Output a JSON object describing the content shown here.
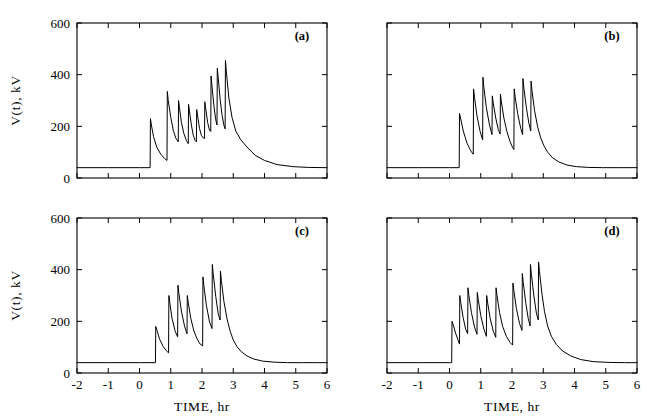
{
  "figure": {
    "axis_titles": {
      "x": "TIME, hr",
      "y": "V(t), kV"
    },
    "panel_tags": [
      "(a)",
      "(b)",
      "(c)",
      "(d)"
    ],
    "x_tick_labels": [
      "-2",
      "-1",
      "0",
      "1",
      "2",
      "3",
      "4",
      "5",
      "6"
    ],
    "y_tick_labels": [
      "0",
      "200",
      "400",
      "600"
    ],
    "line_color": "#000000",
    "background_color": "#ffffff"
  },
  "chart_data": [
    {
      "type": "line",
      "title": "(a)",
      "xlabel": "TIME, hr",
      "ylabel": "V(t), kV",
      "xlim": [
        -2,
        6
      ],
      "ylim": [
        0,
        600
      ],
      "xticks": [
        -2,
        -1,
        0,
        1,
        2,
        3,
        4,
        5,
        6
      ],
      "yticks": [
        0,
        200,
        400,
        600
      ],
      "grid": false,
      "legend": "none",
      "baseline_kv": 40,
      "onset_hr": 0.35,
      "series": [
        {
          "name": "V(t) panel a",
          "x": [
            -2.0,
            -1.0,
            0.0,
            0.34,
            0.35,
            0.38,
            0.45,
            0.55,
            0.68,
            0.8,
            0.88,
            0.89,
            0.92,
            1.0,
            1.08,
            1.16,
            1.24,
            1.25,
            1.28,
            1.34,
            1.42,
            1.5,
            1.56,
            1.57,
            1.6,
            1.66,
            1.72,
            1.78,
            1.82,
            1.83,
            1.86,
            1.92,
            1.98,
            2.04,
            2.08,
            2.09,
            2.12,
            2.18,
            2.24,
            2.28,
            2.29,
            2.32,
            2.38,
            2.44,
            2.48,
            2.49,
            2.52,
            2.58,
            2.64,
            2.7,
            2.74,
            2.75,
            2.78,
            2.86,
            2.96,
            3.08,
            3.24,
            3.44,
            3.7,
            4.0,
            4.4,
            4.9,
            5.4,
            6.0
          ],
          "y": [
            40,
            40,
            40,
            40,
            230,
            205,
            160,
            120,
            92,
            76,
            68,
            335,
            300,
            235,
            185,
            155,
            140,
            300,
            272,
            216,
            172,
            145,
            133,
            285,
            258,
            205,
            166,
            145,
            140,
            265,
            240,
            192,
            165,
            155,
            153,
            295,
            268,
            215,
            185,
            180,
            395,
            355,
            280,
            225,
            205,
            425,
            385,
            305,
            245,
            205,
            190,
            455,
            410,
            310,
            235,
            182,
            148,
            120,
            88,
            68,
            52,
            44,
            41,
            40
          ]
        }
      ]
    },
    {
      "type": "line",
      "title": "(b)",
      "xlabel": "TIME, hr",
      "ylabel": "V(t), kV",
      "xlim": [
        -2,
        6
      ],
      "ylim": [
        0,
        600
      ],
      "xticks": [
        -2,
        -1,
        0,
        1,
        2,
        3,
        4,
        5,
        6
      ],
      "yticks": [
        0,
        200,
        400,
        600
      ],
      "grid": false,
      "legend": "none",
      "baseline_kv": 40,
      "onset_hr": 0.32,
      "series": [
        {
          "name": "V(t) panel b",
          "x": [
            -2.0,
            -1.0,
            0.0,
            0.31,
            0.32,
            0.36,
            0.44,
            0.56,
            0.68,
            0.76,
            0.77,
            0.8,
            0.88,
            0.98,
            1.06,
            1.07,
            1.1,
            1.18,
            1.28,
            1.36,
            1.37,
            1.4,
            1.48,
            1.56,
            1.62,
            1.63,
            1.66,
            1.74,
            1.84,
            1.94,
            2.02,
            2.06,
            2.07,
            2.1,
            2.18,
            2.28,
            2.34,
            2.35,
            2.38,
            2.46,
            2.54,
            2.6,
            2.61,
            2.64,
            2.72,
            2.82,
            2.92,
            3.02,
            3.14,
            3.3,
            3.5,
            3.76,
            4.06,
            4.44,
            4.9,
            5.4,
            6.0
          ],
          "y": [
            40,
            40,
            40,
            40,
            250,
            228,
            182,
            135,
            105,
            92,
            345,
            312,
            240,
            180,
            148,
            390,
            350,
            272,
            205,
            168,
            318,
            290,
            232,
            188,
            170,
            325,
            295,
            232,
            178,
            140,
            118,
            110,
            345,
            315,
            250,
            192,
            168,
            385,
            348,
            272,
            212,
            182,
            375,
            338,
            262,
            198,
            155,
            125,
            100,
            78,
            62,
            50,
            44,
            41,
            40,
            40,
            40
          ]
        }
      ]
    },
    {
      "type": "line",
      "title": "(c)",
      "xlabel": "TIME, hr",
      "ylabel": "V(t), kV",
      "xlim": [
        -2,
        6
      ],
      "ylim": [
        0,
        600
      ],
      "xticks": [
        -2,
        -1,
        0,
        1,
        2,
        3,
        4,
        5,
        6
      ],
      "yticks": [
        0,
        200,
        400,
        600
      ],
      "grid": false,
      "legend": "none",
      "baseline_kv": 40,
      "onset_hr": 0.52,
      "series": [
        {
          "name": "V(t) panel c",
          "x": [
            -2.0,
            -1.0,
            0.0,
            0.51,
            0.52,
            0.56,
            0.64,
            0.76,
            0.86,
            0.93,
            0.94,
            0.97,
            1.04,
            1.14,
            1.22,
            1.23,
            1.26,
            1.34,
            1.44,
            1.52,
            1.53,
            1.56,
            1.64,
            1.74,
            1.84,
            1.94,
            2.02,
            2.03,
            2.06,
            2.14,
            2.24,
            2.32,
            2.33,
            2.36,
            2.44,
            2.52,
            2.58,
            2.59,
            2.62,
            2.7,
            2.8,
            2.9,
            3.0,
            3.12,
            3.26,
            3.44,
            3.66,
            3.94,
            4.3,
            4.74,
            5.24,
            5.7,
            6.0
          ],
          "y": [
            40,
            40,
            40,
            40,
            180,
            165,
            132,
            102,
            86,
            78,
            300,
            272,
            212,
            162,
            140,
            340,
            308,
            240,
            182,
            152,
            300,
            272,
            212,
            163,
            132,
            112,
            105,
            372,
            338,
            262,
            198,
            172,
            420,
            382,
            296,
            228,
            205,
            395,
            358,
            278,
            210,
            162,
            128,
            102,
            82,
            66,
            54,
            46,
            42,
            40,
            40,
            40,
            40
          ]
        }
      ]
    },
    {
      "type": "line",
      "title": "(d)",
      "xlabel": "TIME, hr",
      "ylabel": "V(t), kV",
      "xlim": [
        -2,
        6
      ],
      "ylim": [
        0,
        600
      ],
      "xticks": [
        -2,
        -1,
        0,
        1,
        2,
        3,
        4,
        5,
        6
      ],
      "yticks": [
        0,
        200,
        400,
        600
      ],
      "grid": false,
      "legend": "none",
      "baseline_kv": 40,
      "onset_hr": 0.08,
      "series": [
        {
          "name": "V(t) panel d",
          "x": [
            -2.0,
            -1.0,
            0.0,
            0.07,
            0.08,
            0.12,
            0.2,
            0.28,
            0.32,
            0.33,
            0.36,
            0.44,
            0.52,
            0.58,
            0.59,
            0.62,
            0.7,
            0.8,
            0.88,
            0.89,
            0.92,
            1.0,
            1.1,
            1.18,
            1.19,
            1.22,
            1.3,
            1.4,
            1.48,
            1.49,
            1.52,
            1.6,
            1.7,
            1.82,
            1.94,
            2.02,
            2.03,
            2.06,
            2.14,
            2.24,
            2.32,
            2.33,
            2.36,
            2.44,
            2.52,
            2.58,
            2.59,
            2.62,
            2.7,
            2.78,
            2.84,
            2.85,
            2.88,
            2.96,
            3.04,
            3.14,
            3.26,
            3.42,
            3.62,
            3.88,
            4.2,
            4.6,
            5.1,
            5.6,
            6.0
          ],
          "y": [
            40,
            40,
            40,
            40,
            200,
            186,
            152,
            125,
            112,
            300,
            272,
            212,
            168,
            152,
            330,
            300,
            235,
            178,
            150,
            312,
            284,
            222,
            170,
            142,
            300,
            272,
            212,
            162,
            138,
            330,
            300,
            235,
            180,
            142,
            118,
            108,
            348,
            318,
            250,
            192,
            165,
            385,
            350,
            272,
            210,
            182,
            420,
            382,
            298,
            232,
            205,
            430,
            392,
            305,
            238,
            182,
            142,
            110,
            85,
            66,
            52,
            44,
            41,
            40,
            40
          ]
        }
      ]
    }
  ]
}
